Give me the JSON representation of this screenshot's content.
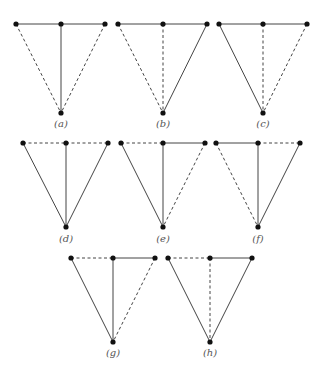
{
  "colors": {
    "edge": "#444444",
    "node": "#111111",
    "label": "#555555",
    "background": "#ffffff"
  },
  "legend": {
    "solid": "solid edge",
    "dashed": "dashed edge"
  },
  "node_layout": "Each graph: three top vertices (left L, middle M, right R) and one bottom vertex B. Edges: L-M, M-R (top), L-B, M-B, R-B.",
  "graphs": [
    {
      "label": "(a)",
      "L": [
        16,
        24
      ],
      "M": [
        61,
        24
      ],
      "R": [
        105,
        24
      ],
      "B": [
        61,
        113
      ],
      "label_pos": [
        61,
        127
      ],
      "edges": {
        "LM": "solid",
        "MR": "solid",
        "LB": "dashed",
        "MB": "solid",
        "RB": "dashed"
      }
    },
    {
      "label": "(b)",
      "L": [
        118,
        24
      ],
      "M": [
        163,
        24
      ],
      "R": [
        207,
        24
      ],
      "B": [
        163,
        113
      ],
      "label_pos": [
        163,
        127
      ],
      "edges": {
        "LM": "solid",
        "MR": "solid",
        "LB": "dashed",
        "MB": "dashed",
        "RB": "solid"
      }
    },
    {
      "label": "(c)",
      "L": [
        219,
        24
      ],
      "M": [
        263,
        24
      ],
      "R": [
        307,
        24
      ],
      "B": [
        263,
        113
      ],
      "label_pos": [
        263,
        127
      ],
      "edges": {
        "LM": "solid",
        "MR": "solid",
        "LB": "solid",
        "MB": "dashed",
        "RB": "dashed"
      }
    },
    {
      "label": "(d)",
      "L": [
        23,
        143
      ],
      "M": [
        66,
        143
      ],
      "R": [
        108,
        143
      ],
      "B": [
        66,
        227
      ],
      "label_pos": [
        66,
        242
      ],
      "edges": {
        "LM": "dashed",
        "MR": "dashed",
        "LB": "solid",
        "MB": "solid",
        "RB": "solid"
      }
    },
    {
      "label": "(e)",
      "L": [
        121,
        143
      ],
      "M": [
        163,
        143
      ],
      "R": [
        205,
        143
      ],
      "B": [
        163,
        227
      ],
      "label_pos": [
        163,
        242
      ],
      "edges": {
        "LM": "dashed",
        "MR": "solid",
        "LB": "solid",
        "MB": "solid",
        "RB": "dashed"
      }
    },
    {
      "label": "(f)",
      "L": [
        216,
        143
      ],
      "M": [
        258,
        143
      ],
      "R": [
        300,
        143
      ],
      "B": [
        258,
        227
      ],
      "label_pos": [
        258,
        242
      ],
      "edges": {
        "LM": "solid",
        "MR": "dashed",
        "LB": "dashed",
        "MB": "solid",
        "RB": "solid"
      }
    },
    {
      "label": "(g)",
      "L": [
        71,
        258
      ],
      "M": [
        113,
        258
      ],
      "R": [
        155,
        258
      ],
      "B": [
        113,
        342
      ],
      "label_pos": [
        113,
        356
      ],
      "edges": {
        "LM": "dashed",
        "MR": "solid",
        "LB": "solid",
        "MB": "solid",
        "RB": "dashed"
      }
    },
    {
      "label": "(h)",
      "L": [
        168,
        258
      ],
      "M": [
        210,
        258
      ],
      "R": [
        252,
        258
      ],
      "B": [
        210,
        342
      ],
      "label_pos": [
        210,
        356
      ],
      "edges": {
        "LM": "dashed",
        "MR": "solid",
        "LB": "solid",
        "MB": "dashed",
        "RB": "solid"
      }
    }
  ]
}
